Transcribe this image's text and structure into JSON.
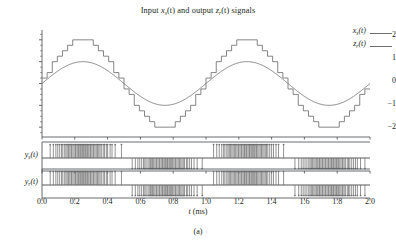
{
  "figure": {
    "title_parts": {
      "p1": "Input ",
      "v1": "x",
      "s1": "s",
      "p2": "(t) and output ",
      "v2": "z",
      "s2": "r",
      "p3": "(t) signals"
    },
    "title_plain": "Input x_s(t) and output z_r(t) signals",
    "caption": "(a)",
    "colors": {
      "line": "#6f6f6f",
      "axis": "#58595b",
      "text": "#231f20",
      "background": "#ffffff"
    }
  },
  "legend": {
    "position": "top-right",
    "entries": [
      {
        "var": "x",
        "sub": "s",
        "tail": "(t)",
        "plain": "x_s(t)"
      },
      {
        "var": "z",
        "sub": "r",
        "tail": "(t)",
        "plain": "z_r(t)"
      }
    ]
  },
  "axes": {
    "xlabel_parts": {
      "v": "t",
      "u": " (ms)"
    },
    "xlabel_plain": "t (ms)",
    "xticks": [
      "0.0",
      "0.2",
      "0.4",
      "0.6",
      "0.8",
      "1.0",
      "1.2",
      "1.4",
      "1.6",
      "1.8",
      "2.0"
    ],
    "xlim": [
      0.0,
      2.0
    ],
    "main_yticks": [
      "2",
      "1",
      "0",
      "-1",
      "-2"
    ],
    "main_yticks_display": [
      "2",
      "1",
      "0",
      "−1",
      "−2"
    ],
    "main_ylim": [
      -2.45,
      2.45
    ],
    "panel_labels": [
      {
        "var": "y",
        "sub": "s",
        "tail": "(t)",
        "plain": "y_s(t)"
      },
      {
        "var": "y",
        "sub": "r",
        "tail": "(t)",
        "plain": "y_r(t)"
      }
    ]
  },
  "chart_data": {
    "type": "line",
    "xlabel": "t (ms)",
    "ylabel": "",
    "xlim": [
      0.0,
      2.0
    ],
    "ylim": [
      -2.45,
      2.45
    ],
    "grid": false,
    "legend_position": "upper right",
    "xticks": [
      0.0,
      0.2,
      0.4,
      0.6,
      0.8,
      1.0,
      1.2,
      1.4,
      1.6,
      1.8,
      2.0
    ],
    "yticks": [
      -2,
      -1,
      0,
      1,
      2
    ],
    "series": [
      {
        "name": "x_s(t)",
        "kind": "sine",
        "style": "smooth",
        "amplitude": 1.0,
        "periods": 2,
        "period_ms": 1.0,
        "phase": 0.0,
        "description": "Smooth input sinusoid, amplitude 1, two cycles over 0-2 ms"
      },
      {
        "name": "z_r(t)",
        "kind": "quantized-sine",
        "style": "staircase",
        "amplitude": 2.0,
        "periods": 2,
        "period_ms": 1.0,
        "phase": 0.0,
        "steps_per_period": 32,
        "quantization_levels": 17,
        "description": "Reconstructed staircase output, amplitude ~2, 32 steps per cycle"
      }
    ],
    "subpanels": [
      {
        "name": "y_s(t)",
        "type": "pulse-train",
        "bipolar": true,
        "description": "Bipolar pulse density modulated stream; upward pulses while signal positive (0.0-0.5, 1.0-1.5 ms), downward pulses while negative (0.5-1.0, 1.5-2.0 ms); pulse density peaks near signal extrema",
        "pulse_count": 120
      },
      {
        "name": "y_r(t)",
        "type": "pulse-train",
        "bipolar": true,
        "description": "Bipolar pulse density modulated stream, near-identical to y_s(t)",
        "pulse_count": 120
      }
    ]
  }
}
